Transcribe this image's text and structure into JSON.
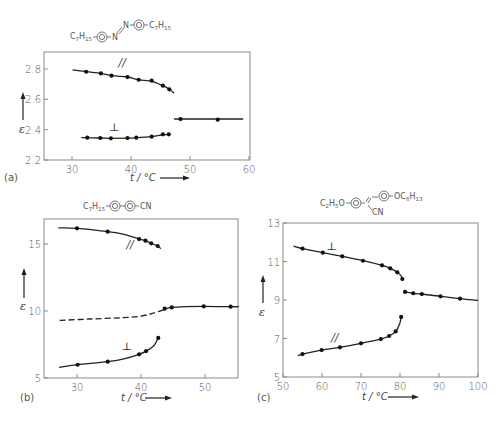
{
  "chart_data": [
    {
      "id": "a",
      "type": "line",
      "panel_label": "(a)",
      "compound": "C7H15-C6H4-N=N-C6H4-C7H15 (azoxy)",
      "compound_parts": {
        "left": "C7H15",
        "right": "C7H15",
        "linker": "N=N"
      },
      "xlabel": "t / °C",
      "ylabel": "ε",
      "xlim": [
        25,
        60
      ],
      "ylim": [
        2.2,
        2.9
      ],
      "xticks": [
        30,
        40,
        50,
        60
      ],
      "yticks": [
        2.2,
        2.4,
        2.6,
        2.8
      ],
      "ytick_labels": [
        "2.2",
        "2.4",
        "2.6",
        "2.8"
      ],
      "grid": false,
      "series": [
        {
          "name": "∥",
          "label_pos": [
            38.5,
            2.82
          ],
          "points": [
            [
              32.4,
              2.782
            ],
            [
              34.9,
              2.771
            ],
            [
              36.7,
              2.756
            ],
            [
              39.4,
              2.747
            ],
            [
              41.3,
              2.729
            ],
            [
              43.5,
              2.723
            ],
            [
              45.4,
              2.69
            ],
            [
              46.5,
              2.666
            ]
          ],
          "curve": [
            [
              30.1,
              2.795
            ],
            [
              32.4,
              2.782
            ],
            [
              34.9,
              2.771
            ],
            [
              36.7,
              2.756
            ],
            [
              39.4,
              2.747
            ],
            [
              41.3,
              2.729
            ],
            [
              43.5,
              2.718
            ],
            [
              45.4,
              2.69
            ],
            [
              46.5,
              2.666
            ],
            [
              47.3,
              2.64
            ]
          ],
          "dashed": false
        },
        {
          "name": "⊥",
          "label_pos": [
            37.2,
            2.39
          ],
          "points": [
            [
              32.6,
              2.347
            ],
            [
              34.8,
              2.345
            ],
            [
              36.6,
              2.343
            ],
            [
              39.4,
              2.345
            ],
            [
              40.9,
              2.347
            ],
            [
              43.5,
              2.354
            ],
            [
              45.4,
              2.369
            ],
            [
              46.4,
              2.369
            ]
          ],
          "curve": [
            [
              31.6,
              2.347
            ],
            [
              34.8,
              2.345
            ],
            [
              36.6,
              2.343
            ],
            [
              39.4,
              2.344
            ],
            [
              40.9,
              2.347
            ],
            [
              43.5,
              2.354
            ],
            [
              45.4,
              2.366
            ],
            [
              46.4,
              2.369
            ]
          ],
          "dashed": false
        },
        {
          "name": "isotropic",
          "label_pos": null,
          "points": [
            [
              48.4,
              2.47
            ],
            [
              54.7,
              2.466
            ]
          ],
          "curve": [
            [
              47.3,
              2.47
            ],
            [
              59.0,
              2.47
            ]
          ],
          "dashed": false
        }
      ]
    },
    {
      "id": "b",
      "type": "line",
      "panel_label": "(b)",
      "compound": "C7H15-C6H4-C6H4-CN",
      "compound_parts": {
        "left": "C7H15",
        "right": "CN"
      },
      "xlabel": "t / °C",
      "ylabel": "ε",
      "xlim": [
        25,
        55.5
      ],
      "ylim": [
        5,
        17
      ],
      "xticks": [
        30,
        40,
        50
      ],
      "yticks": [
        5,
        10,
        15
      ],
      "ytick_labels": [
        "5",
        "10",
        "15"
      ],
      "grid": false,
      "series": [
        {
          "name": "∥",
          "label_pos": [
            38.3,
            14.7
          ],
          "points": [
            [
              30.0,
              16.17
            ],
            [
              34.8,
              15.92
            ],
            [
              39.7,
              15.37
            ],
            [
              40.7,
              15.25
            ],
            [
              41.6,
              15.05
            ],
            [
              42.6,
              14.85
            ]
          ],
          "curve": [
            [
              27.1,
              16.2
            ],
            [
              30.0,
              16.17
            ],
            [
              34.8,
              15.92
            ],
            [
              37.5,
              15.7
            ],
            [
              39.7,
              15.37
            ],
            [
              40.7,
              15.25
            ],
            [
              41.6,
              15.05
            ],
            [
              42.6,
              14.85
            ],
            [
              43.1,
              14.65
            ]
          ],
          "dashed": false
        },
        {
          "name": "⊥",
          "label_pos": [
            37.8,
            7.1
          ],
          "points": [
            [
              30.1,
              5.99
            ],
            [
              34.8,
              6.22
            ],
            [
              39.7,
              6.77
            ],
            [
              40.8,
              7.01
            ],
            [
              42.7,
              7.99
            ]
          ],
          "curve": [
            [
              27.2,
              5.8
            ],
            [
              30.1,
              5.99
            ],
            [
              34.8,
              6.22
            ],
            [
              37.5,
              6.45
            ],
            [
              39.7,
              6.77
            ],
            [
              40.8,
              7.01
            ],
            [
              42.0,
              7.4
            ],
            [
              42.7,
              7.99
            ]
          ],
          "dashed": false
        },
        {
          "name": "isotropic (extrapolated)",
          "label_pos": null,
          "points": [],
          "curve": [
            [
              27.3,
              9.3
            ],
            [
              32.0,
              9.4
            ],
            [
              37.0,
              9.5
            ],
            [
              40.0,
              9.62
            ],
            [
              42.0,
              9.85
            ],
            [
              43.7,
              10.12
            ]
          ],
          "dashed": true
        },
        {
          "name": "isotropic",
          "label_pos": null,
          "points": [
            [
              43.7,
              10.17
            ],
            [
              44.8,
              10.27
            ],
            [
              49.8,
              10.35
            ],
            [
              54.0,
              10.32
            ]
          ],
          "curve": [
            [
              43.7,
              10.15
            ],
            [
              44.8,
              10.27
            ],
            [
              47.0,
              10.33
            ],
            [
              49.8,
              10.35
            ],
            [
              54.0,
              10.32
            ],
            [
              55.3,
              10.32
            ]
          ],
          "dashed": false
        }
      ]
    },
    {
      "id": "c",
      "type": "line",
      "panel_label": "(c)",
      "compound": "C2H5O-C6H4-C(CN)=CH-C6H4-OC6H13",
      "compound_parts": {
        "left": "C2H5O",
        "right": "OC6H13",
        "side": "CN"
      },
      "xlabel": "t / °C",
      "ylabel": "ε",
      "xlim": [
        50,
        100
      ],
      "ylim": [
        5,
        13
      ],
      "xticks": [
        50,
        60,
        70,
        80,
        90,
        100
      ],
      "yticks": [
        5,
        7,
        9,
        11,
        13
      ],
      "ytick_labels": [
        "5",
        "7",
        "9",
        "11",
        "13"
      ],
      "grid": false,
      "series": [
        {
          "name": "⊥",
          "label_pos": [
            62.5,
            11.6
          ],
          "points": [
            [
              55.0,
              11.67
            ],
            [
              60.2,
              11.46
            ],
            [
              65.2,
              11.27
            ],
            [
              70.5,
              11.04
            ],
            [
              75.4,
              10.8
            ],
            [
              77.5,
              10.64
            ],
            [
              79.3,
              10.44
            ],
            [
              80.6,
              10.09
            ]
          ],
          "curve": [
            [
              52.7,
              11.8
            ],
            [
              55.0,
              11.67
            ],
            [
              60.2,
              11.46
            ],
            [
              65.2,
              11.27
            ],
            [
              70.5,
              11.04
            ],
            [
              75.4,
              10.8
            ],
            [
              77.5,
              10.64
            ],
            [
              79.3,
              10.44
            ],
            [
              80.3,
              10.25
            ],
            [
              80.6,
              10.09
            ]
          ],
          "dashed": false
        },
        {
          "name": "isotropic",
          "label_pos": null,
          "points": [
            [
              81.3,
              9.42
            ],
            [
              83.4,
              9.35
            ],
            [
              85.6,
              9.31
            ],
            [
              90.4,
              9.19
            ],
            [
              95.4,
              9.07
            ]
          ],
          "curve": [
            [
              81.3,
              9.42
            ],
            [
              83.4,
              9.35
            ],
            [
              85.6,
              9.31
            ],
            [
              90.4,
              9.19
            ],
            [
              95.4,
              9.07
            ],
            [
              100.0,
              8.98
            ]
          ],
          "dashed": false
        },
        {
          "name": "∥",
          "label_pos": [
            63.3,
            6.85
          ],
          "points": [
            [
              55.0,
              6.19
            ],
            [
              59.9,
              6.4
            ],
            [
              64.6,
              6.54
            ],
            [
              70.0,
              6.75
            ],
            [
              75.1,
              6.97
            ],
            [
              77.2,
              7.13
            ],
            [
              78.9,
              7.37
            ],
            [
              80.3,
              8.12
            ]
          ],
          "curve": [
            [
              53.8,
              6.1
            ],
            [
              55.0,
              6.19
            ],
            [
              59.9,
              6.4
            ],
            [
              64.6,
              6.54
            ],
            [
              70.0,
              6.75
            ],
            [
              75.1,
              6.97
            ],
            [
              77.2,
              7.13
            ],
            [
              78.9,
              7.37
            ],
            [
              79.9,
              7.75
            ],
            [
              80.3,
              8.12
            ]
          ],
          "dashed": false
        }
      ]
    }
  ],
  "labels": {
    "x_axis_title": "t / °C",
    "y_axis_title": "ε",
    "panel_a": "(a)",
    "panel_b": "(b)",
    "panel_c": "(c)",
    "parallel": "∥",
    "perpendicular": "⊥"
  }
}
